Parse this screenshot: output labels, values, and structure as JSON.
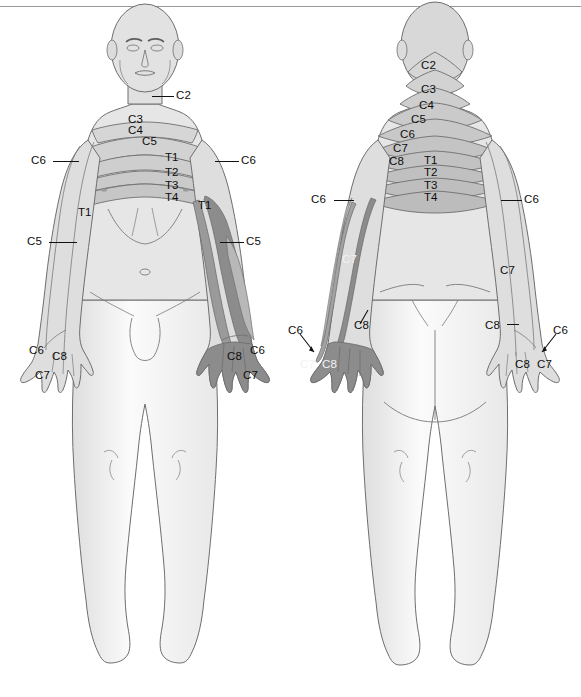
{
  "diagram": {
    "type": "dermatome-map",
    "views": [
      "anterior",
      "posterior"
    ],
    "background_color": "#ffffff",
    "skin_fill": "#e2e2e2",
    "skin_fill_light": "#f2f2f2",
    "band_fill": "#d0d0d0",
    "highlight_fill": "#8c8c8c",
    "highlight_fill_mid": "#b4b4b4",
    "outline_color": "#6e6e6e",
    "label_color": "#0d0d0d",
    "rule_color": "#9a9a9a"
  },
  "anterior": {
    "view_label": "anterior",
    "labels": [
      {
        "id": "ant-c2",
        "text": "C2",
        "x": 176,
        "y": 90,
        "leader": {
          "x": 152,
          "y": 96,
          "w": 22
        }
      },
      {
        "id": "ant-c3",
        "text": "C3",
        "x": 128,
        "y": 114,
        "leader": null
      },
      {
        "id": "ant-c4",
        "text": "C4",
        "x": 128,
        "y": 125,
        "leader": null
      },
      {
        "id": "ant-c5-mid",
        "text": "C5",
        "x": 142,
        "y": 136,
        "leader": null
      },
      {
        "id": "ant-c6-left",
        "text": "C6",
        "x": 31,
        "y": 155,
        "leader": {
          "x": 53,
          "y": 161,
          "w": 26
        }
      },
      {
        "id": "ant-c6-right",
        "text": "C6",
        "x": 241,
        "y": 155,
        "leader": {
          "x": 215,
          "y": 161,
          "w": 24
        }
      },
      {
        "id": "ant-t1-chest",
        "text": "T1",
        "x": 165,
        "y": 152,
        "leader": null
      },
      {
        "id": "ant-t2-chest",
        "text": "T2",
        "x": 165,
        "y": 167,
        "leader": null
      },
      {
        "id": "ant-t3-chest",
        "text": "T3",
        "x": 165,
        "y": 180,
        "leader": null
      },
      {
        "id": "ant-t4-chest",
        "text": "T4",
        "x": 165,
        "y": 192,
        "leader": null
      },
      {
        "id": "ant-t1-left",
        "text": "T1",
        "x": 78,
        "y": 207,
        "leader": null
      },
      {
        "id": "ant-t1-right",
        "text": "T1",
        "x": 198,
        "y": 200,
        "leader": null
      },
      {
        "id": "ant-c5-left",
        "text": "C5",
        "x": 27,
        "y": 236,
        "leader": {
          "x": 49,
          "y": 242,
          "w": 28
        }
      },
      {
        "id": "ant-c5-right",
        "text": "C5",
        "x": 246,
        "y": 236,
        "leader": {
          "x": 220,
          "y": 242,
          "w": 24
        }
      },
      {
        "id": "ant-c6-lhand",
        "text": "C6",
        "x": 29,
        "y": 345,
        "leader": null
      },
      {
        "id": "ant-c8-lhand",
        "text": "C8",
        "x": 52,
        "y": 351,
        "leader": null
      },
      {
        "id": "ant-c7-lhand",
        "text": "C7",
        "x": 35,
        "y": 370,
        "leader": null
      },
      {
        "id": "ant-c8-rhand",
        "text": "C8",
        "x": 227,
        "y": 351,
        "leader": null
      },
      {
        "id": "ant-c6-rhand",
        "text": "C6",
        "x": 250,
        "y": 345,
        "leader": null
      },
      {
        "id": "ant-c7-rhand",
        "text": "C7",
        "x": 243,
        "y": 370,
        "leader": null
      }
    ]
  },
  "posterior": {
    "view_label": "posterior",
    "labels": [
      {
        "id": "pos-c2",
        "text": "C2",
        "x": 421,
        "y": 60,
        "leader": null
      },
      {
        "id": "pos-c3",
        "text": "C3",
        "x": 421,
        "y": 84,
        "leader": null
      },
      {
        "id": "pos-c4",
        "text": "C4",
        "x": 419,
        "y": 100,
        "leader": null
      },
      {
        "id": "pos-c5",
        "text": "C5",
        "x": 411,
        "y": 114,
        "leader": null
      },
      {
        "id": "pos-c6-neck",
        "text": "C6",
        "x": 400,
        "y": 129,
        "leader": null
      },
      {
        "id": "pos-c7-neck",
        "text": "C7",
        "x": 393,
        "y": 143,
        "leader": null
      },
      {
        "id": "pos-c8-neck",
        "text": "C8",
        "x": 389,
        "y": 156,
        "leader": null
      },
      {
        "id": "pos-t1",
        "text": "T1",
        "x": 424,
        "y": 155,
        "leader": null
      },
      {
        "id": "pos-t2",
        "text": "T2",
        "x": 424,
        "y": 167,
        "leader": null
      },
      {
        "id": "pos-t3",
        "text": "T3",
        "x": 424,
        "y": 180,
        "leader": null
      },
      {
        "id": "pos-t4",
        "text": "T4",
        "x": 424,
        "y": 192,
        "leader": null
      },
      {
        "id": "pos-c6-left",
        "text": "C6",
        "x": 311,
        "y": 194,
        "leader": {
          "x": 334,
          "y": 200,
          "w": 20
        }
      },
      {
        "id": "pos-c6-right",
        "text": "C6",
        "x": 524,
        "y": 194,
        "leader": {
          "x": 501,
          "y": 200,
          "w": 21
        }
      },
      {
        "id": "pos-c7-larm",
        "text": "C7",
        "x": 342,
        "y": 254,
        "leader": null,
        "on_dark": true
      },
      {
        "id": "pos-c7-rarm",
        "text": "C7",
        "x": 500,
        "y": 265,
        "leader": null
      },
      {
        "id": "pos-c8-larm",
        "text": "C8",
        "x": 354,
        "y": 320,
        "leader": null
      },
      {
        "id": "pos-c8-rarm",
        "text": "C8",
        "x": 485,
        "y": 320,
        "leader": {
          "x": 507,
          "y": 324,
          "w": 12
        }
      },
      {
        "id": "pos-c6-lhand",
        "text": "C6",
        "x": 288,
        "y": 325,
        "leader": null
      },
      {
        "id": "pos-c7-lhand",
        "text": "C7",
        "x": 300,
        "y": 359,
        "leader": null,
        "on_dark": true
      },
      {
        "id": "pos-c8-lhand",
        "text": "C8",
        "x": 322,
        "y": 359,
        "leader": null,
        "on_dark": true
      },
      {
        "id": "pos-c6-rhand",
        "text": "C6",
        "x": 553,
        "y": 325,
        "leader": null
      },
      {
        "id": "pos-c8-rhand",
        "text": "C8",
        "x": 515,
        "y": 359,
        "leader": null
      },
      {
        "id": "pos-c7-rhand",
        "text": "C7",
        "x": 537,
        "y": 359,
        "leader": null
      }
    ]
  },
  "dermatome_levels": [
    "C2",
    "C3",
    "C4",
    "C5",
    "C6",
    "C7",
    "C8",
    "T1",
    "T2",
    "T3",
    "T4"
  ]
}
